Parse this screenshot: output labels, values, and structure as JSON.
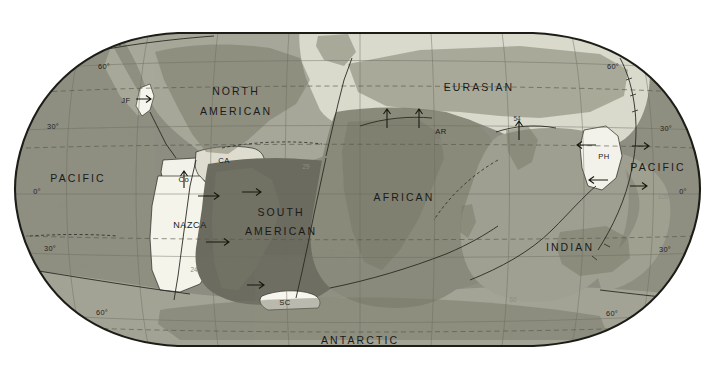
{
  "map": {
    "title": "Tectonic Plates of the World",
    "projection": "Robinson",
    "background_color": "#ffffff",
    "border_color": "#1d1d18",
    "ocean_base_color": "#9a9a8c",
    "graticule_color": "#6d6d5f",
    "plate_boundary_color": "#2a2a24"
  },
  "plates": [
    {
      "id": "pacific-west",
      "label": "PACIFIC",
      "size": "major",
      "fill": "#8f8f82",
      "x": 78,
      "y": 179
    },
    {
      "id": "pacific-east",
      "label": "PACIFIC",
      "size": "major",
      "fill": "#8f8f82",
      "x": 658,
      "y": 168
    },
    {
      "id": "north-american",
      "label": "NORTH",
      "size": "major",
      "fill": "#a8a89a",
      "x": 236,
      "y": 92
    },
    {
      "id": "north-american2",
      "label": "AMERICAN",
      "size": "major",
      "fill": "#a8a89a",
      "x": 236,
      "y": 112
    },
    {
      "id": "south-american",
      "label": "SOUTH",
      "size": "major",
      "fill": "#6e6e62",
      "x": 281,
      "y": 213
    },
    {
      "id": "south-american2",
      "label": "AMERICAN",
      "size": "major",
      "fill": "#6e6e62",
      "x": 281,
      "y": 232
    },
    {
      "id": "eurasian",
      "label": "EURASIAN",
      "size": "major",
      "fill": "#d9d9cc",
      "x": 479,
      "y": 88
    },
    {
      "id": "african",
      "label": "AFRICAN",
      "size": "major",
      "fill": "#8a8a7c",
      "x": 404,
      "y": 198
    },
    {
      "id": "indian",
      "label": "INDIAN",
      "size": "major",
      "fill": "#a0a092",
      "x": 570,
      "y": 248
    },
    {
      "id": "antarctic",
      "label": "ANTARCTIC",
      "size": "major",
      "fill": "#a4a496",
      "x": 360,
      "y": 341
    },
    {
      "id": "nazca",
      "label": "NAZCA",
      "size": "minor",
      "fill": "#f4f4ec",
      "x": 190,
      "y": 226
    },
    {
      "id": "cocos",
      "label": "Co",
      "size": "minor",
      "fill": "#f2f2ea",
      "x": 184,
      "y": 180
    },
    {
      "id": "caribbean",
      "label": "CA",
      "size": "minor",
      "fill": "#dedcd0",
      "x": 224,
      "y": 161
    },
    {
      "id": "juan-de-fuca",
      "label": "JF",
      "size": "minor",
      "fill": "#f6f6ee",
      "x": 126,
      "y": 101
    },
    {
      "id": "scotia",
      "label": "SC",
      "size": "minor",
      "fill": "#f6f6ee",
      "x": 285,
      "y": 303
    },
    {
      "id": "arabian",
      "label": "AR",
      "size": "minor",
      "fill": "#e2e0d4",
      "x": 441,
      "y": 132
    },
    {
      "id": "philippine",
      "label": "PH",
      "size": "minor",
      "fill": "#f2f2ea",
      "x": 604,
      "y": 157
    }
  ],
  "graticule": {
    "latitudes_left": [
      "60",
      "30",
      "0",
      "30",
      "60"
    ],
    "latitudes_right": [
      "60",
      "30",
      "0",
      "30",
      "60"
    ],
    "degree_symbol": "°"
  },
  "lat_labels_left": [
    {
      "text": "60°",
      "x": 104,
      "y": 69
    },
    {
      "text": "30°",
      "x": 53,
      "y": 129
    },
    {
      "text": "0°",
      "x": 37,
      "y": 194
    },
    {
      "text": "30°",
      "x": 50,
      "y": 251
    },
    {
      "text": "60°",
      "x": 102,
      "y": 315
    }
  ],
  "lat_labels_right": [
    {
      "text": "60°",
      "x": 613,
      "y": 69
    },
    {
      "text": "30°",
      "x": 666,
      "y": 131
    },
    {
      "text": "0°",
      "x": 683,
      "y": 194
    },
    {
      "text": "30°",
      "x": 665,
      "y": 252
    },
    {
      "text": "60°",
      "x": 612,
      "y": 316
    }
  ],
  "rate_annotations": [
    {
      "id": "rate-indian-54",
      "text": "54",
      "x": 517,
      "y": 121,
      "faint": false
    },
    {
      "id": "rate-arabian-16",
      "text": "16",
      "x": 438,
      "y": 144,
      "faint": true
    },
    {
      "id": "rate-nazca-24",
      "text": "24",
      "x": 194,
      "y": 272,
      "faint": true
    },
    {
      "id": "rate-pac-105",
      "text": "105",
      "x": 663,
      "y": 199,
      "faint": true
    },
    {
      "id": "rate-pac-70",
      "text": "70",
      "x": 130,
      "y": 137,
      "faint": true
    },
    {
      "id": "rate-atl-29",
      "text": "29",
      "x": 306,
      "y": 169,
      "faint": true
    },
    {
      "id": "rate-pac-50",
      "text": "50",
      "x": 85,
      "y": 268,
      "faint": true
    },
    {
      "id": "rate-ind-60",
      "text": "60",
      "x": 513,
      "y": 302,
      "faint": true
    },
    {
      "id": "rate-sa-77",
      "text": "77",
      "x": 352,
      "y": 265,
      "faint": true
    },
    {
      "id": "rate-pac-90",
      "text": "90",
      "x": 62,
      "y": 208,
      "faint": true
    }
  ]
}
